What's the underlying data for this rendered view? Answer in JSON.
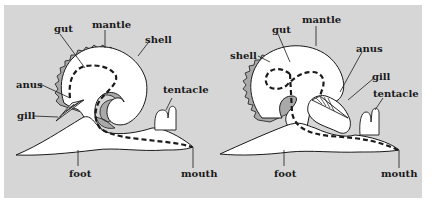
{
  "figure": {
    "background_color": "#d6d6d6",
    "body_color": "#ffffff",
    "shell_color": "#a9a9a9",
    "outline_color": "#1a1a1a"
  },
  "left_diagram": {
    "labels": {
      "gut": "gut",
      "mantle": "mantle",
      "shell": "shell",
      "anus": "anus",
      "gill": "gill",
      "tentacle": "tentacle",
      "foot": "foot",
      "mouth": "mouth"
    }
  },
  "right_diagram": {
    "labels": {
      "gut": "gut",
      "mantle": "mantle",
      "shell": "shell",
      "anus": "anus",
      "gill": "gill",
      "tentacle": "tentacle",
      "foot": "foot",
      "mouth": "mouth"
    }
  }
}
